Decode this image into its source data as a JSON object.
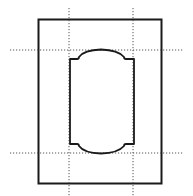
{
  "diagram": {
    "title": "",
    "colors": {
      "stroke": "#1a1a1a",
      "guide": "#555555",
      "background": "#ffffff"
    },
    "outer_frame": {
      "x": 38,
      "y": 19,
      "width": 124,
      "height": 165
    },
    "guides": {
      "vertical": [
        69,
        133
      ],
      "horizontal": [
        50,
        153
      ]
    },
    "label_shape": {
      "left": 69,
      "right": 134,
      "top": 49,
      "bottom": 154,
      "shoulder_top": 59,
      "shoulder_bottom": 144
    }
  }
}
